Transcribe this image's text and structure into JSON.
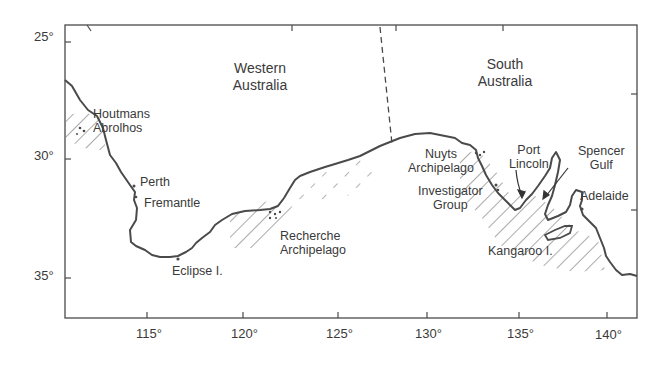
{
  "map": {
    "title": "",
    "regions": [
      {
        "name": "Western Australia",
        "line1": "Western",
        "line2": "Australia"
      },
      {
        "name": "South Australia",
        "line1": "South",
        "line2": "Australia"
      }
    ],
    "places": {
      "houtmans": {
        "line1": "Houtmans",
        "line2": "Abrolhos"
      },
      "perth": "Perth",
      "fremantle": "Fremantle",
      "eclipse": "Eclipse I.",
      "recherche": {
        "line1": "Recherche",
        "line2": "Archipelago"
      },
      "nuyts": {
        "line1": "Nuyts",
        "line2": "Archipelago"
      },
      "investigator": {
        "line1": "Investigator",
        "line2": "Group"
      },
      "port_lincoln": {
        "line1": "Port",
        "line2": "Lincoln"
      },
      "spencer": {
        "line1": "Spencer",
        "line2": "Gulf"
      },
      "adelaide": "Adelaide",
      "kangaroo": "Kangaroo I."
    },
    "latitude_ticks": [
      "25°",
      "30°",
      "35°"
    ],
    "longitude_ticks": [
      "115°",
      "120°",
      "125°",
      "130°",
      "135°",
      "140°"
    ],
    "colors": {
      "line": "#4a4a4a",
      "background": "#ffffff"
    }
  }
}
